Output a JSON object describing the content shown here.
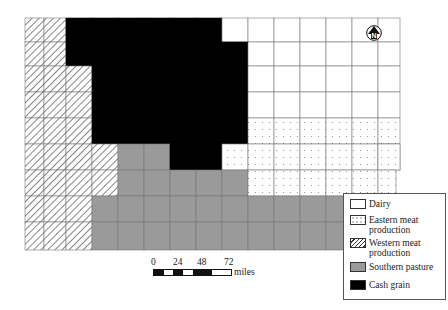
{
  "map": {
    "title": "Iowa agricultural regions by county",
    "regions": {
      "D": {
        "name": "Dairy",
        "fill": "#ffffff"
      },
      "E": {
        "name": "Eastern meat production",
        "fill": "dotted"
      },
      "W": {
        "name": "Western meat production",
        "fill": "hatched"
      },
      "S": {
        "name": "Southern pasture",
        "fill": "#9a9a9a"
      },
      "C": {
        "name": "Cash grain",
        "fill": "#000000"
      }
    },
    "county_grid": [
      "WWCCCCCCDDDDDDD",
      "WWCCCCCCCDDDDDD",
      "WWWCCCCCCDDDDDD",
      "WWWCCCCCCDDDDDD",
      "WWWCCCCCCEEEEEE",
      "WWWWSSCCEEEEEEE",
      "WWWWSSSSSEEEEE.",
      "WWWSSSSSSSSSSS.",
      "WWWSSSSSSSSSSS."
    ]
  },
  "legend": {
    "items": [
      {
        "key": "dairy",
        "label_lines": [
          "Dairy"
        ]
      },
      {
        "key": "east",
        "label_lines": [
          "Eastern meat",
          "production"
        ]
      },
      {
        "key": "west",
        "label_lines": [
          "Western meat",
          "production"
        ]
      },
      {
        "key": "south",
        "label_lines": [
          "Southern pasture"
        ]
      },
      {
        "key": "cash",
        "label_lines": [
          "Cash grain"
        ]
      }
    ]
  },
  "scale": {
    "ticks": [
      "0",
      "24",
      "48",
      "72"
    ],
    "unit": "miles"
  },
  "north_arrow": {
    "label": "N",
    "icon": "north-arrow-icon"
  }
}
